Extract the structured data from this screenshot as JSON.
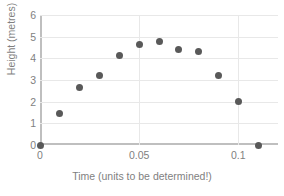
{
  "chart_data": {
    "type": "scatter",
    "title": "",
    "xlabel": "Time (units to be determined!)",
    "ylabel": "Height (metres)",
    "xlim": [
      0,
      0.12
    ],
    "ylim": [
      0,
      6
    ],
    "grid": true,
    "legend": false,
    "marker_color": "#595959",
    "axis_color": "#bfbfbf",
    "gridline_color": "#e8e8e8",
    "label_color": "#7f7f7f",
    "x_ticks": [
      {
        "value": 0,
        "label": "0"
      },
      {
        "value": 0.05,
        "label": "0.05"
      },
      {
        "value": 0.1,
        "label": "0.1"
      }
    ],
    "y_ticks": [
      {
        "value": 0,
        "label": "0"
      },
      {
        "value": 1,
        "label": "1"
      },
      {
        "value": 2,
        "label": "2"
      },
      {
        "value": 3,
        "label": "3"
      },
      {
        "value": 4,
        "label": "4"
      },
      {
        "value": 5,
        "label": "5"
      },
      {
        "value": 6,
        "label": "6"
      }
    ],
    "x": [
      0,
      0.01,
      0.02,
      0.03,
      0.04,
      0.05,
      0.06,
      0.07,
      0.08,
      0.09,
      0.1,
      0.11
    ],
    "y": [
      0,
      1.45,
      2.65,
      3.2,
      4.15,
      4.65,
      4.8,
      4.4,
      4.3,
      3.2,
      2.0,
      0
    ]
  }
}
